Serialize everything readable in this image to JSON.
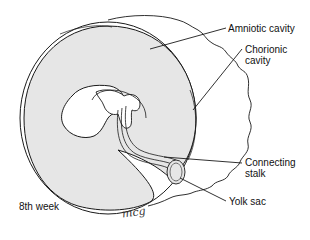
{
  "figure": {
    "caption_stage": "8th week",
    "signature": "mcg",
    "colors": {
      "amniotic_fill": "#e6e6e6",
      "outline": "#1a1a1a",
      "background": "#ffffff"
    }
  },
  "labels": [
    {
      "id": "amniotic-cavity",
      "text": "Amniotic cavity"
    },
    {
      "id": "chorionic-cavity",
      "text": "Chorionic\ncavity"
    },
    {
      "id": "connecting-stalk",
      "text": "Connecting\nstalk"
    },
    {
      "id": "yolk-sac",
      "text": "Yolk sac"
    }
  ]
}
